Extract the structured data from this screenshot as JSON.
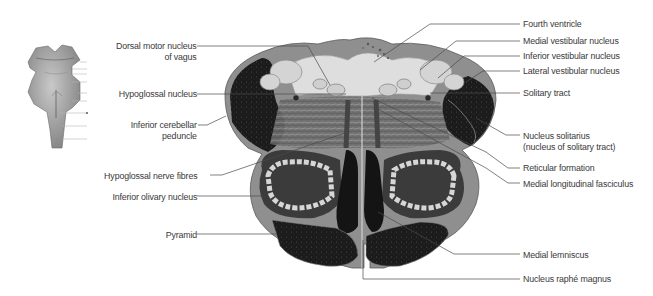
{
  "figure": {
    "colors": {
      "background": "#ffffff",
      "label_text": "#3a3a3a",
      "leader_line": "#4a4a4a",
      "tissue_dark": "#1c1c1c",
      "tissue_mid": "#8c8c8c",
      "tissue_light": "#d8d8d8"
    }
  },
  "thumbnail": {
    "label": "brainstem-orientation-thumbnail",
    "tick_count": 8
  },
  "labels_left": [
    {
      "id": "dorsal-motor-nucleus-of-vagus",
      "line1": "Dorsal motor nucleus",
      "line2": "of vagus"
    },
    {
      "id": "hypoglossal-nucleus",
      "line1": "Hypoglossal nucleus",
      "line2": ""
    },
    {
      "id": "inferior-cerebellar-peduncle",
      "line1": "Inferior cerebellar",
      "line2": "peduncle"
    },
    {
      "id": "hypoglossal-nerve-fibres",
      "line1": "Hypoglossal nerve fibres",
      "line2": ""
    },
    {
      "id": "inferior-olivary-nucleus",
      "line1": "Inferior olivary nucleus",
      "line2": ""
    },
    {
      "id": "pyramid",
      "line1": "Pyramid",
      "line2": ""
    }
  ],
  "labels_right": [
    {
      "id": "fourth-ventricle",
      "line1": "Fourth ventricle",
      "line2": ""
    },
    {
      "id": "medial-vestibular-nucleus",
      "line1": "Medial vestibular nucleus",
      "line2": ""
    },
    {
      "id": "inferior-vestibular-nucleus",
      "line1": "Inferior vestibular nucleus",
      "line2": ""
    },
    {
      "id": "lateral-vestibular-nucleus",
      "line1": "Lateral vestibular nucleus",
      "line2": ""
    },
    {
      "id": "solitary-tract",
      "line1": "Solitary tract",
      "line2": ""
    },
    {
      "id": "nucleus-solitarius",
      "line1": "Nucleus solitarius",
      "line2": "(nucleus of solitary tract)"
    },
    {
      "id": "reticular-formation",
      "line1": "Reticular formation",
      "line2": ""
    },
    {
      "id": "medial-longitudinal-fasciculus",
      "line1": "Medial longitudinal fasciculus",
      "line2": ""
    },
    {
      "id": "medial-lemniscus",
      "line1": "Medial lemniscus",
      "line2": ""
    },
    {
      "id": "nucleus-raphe-magnus",
      "line1": "Nucleus raphé magnus",
      "line2": ""
    }
  ]
}
